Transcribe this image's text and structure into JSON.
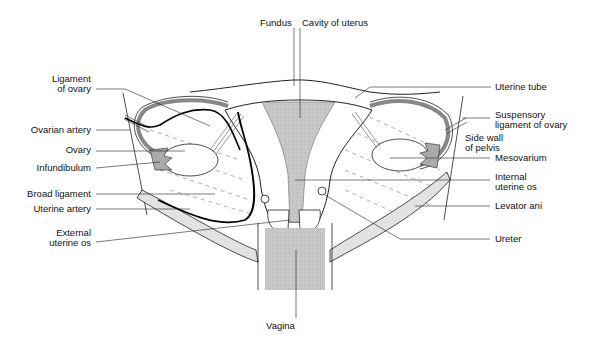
{
  "figure": {
    "colors": {
      "line": "#222222",
      "cavity_fill": "#c8c8c8",
      "muscle_fill": "#e2e2e2",
      "artery": "#000000",
      "background": "#ffffff"
    }
  },
  "labels": {
    "fundus": "Fundus",
    "cavity_of_uterus": "Cavity of uterus",
    "ligament_of_ovary": "Ligament\nof ovary",
    "ovarian_artery": "Ovarian artery",
    "ovary": "Ovary",
    "infundibulum": "Infundibulum",
    "broad_ligament": "Broad ligament",
    "uterine_artery": "Uterine artery",
    "external_uterine_os": "External\nuterine os",
    "uterine_tube": "Uterine tube",
    "suspensory_ligament": "Suspensory\nligament of ovary",
    "side_wall_of_pelvis": "Side wall\nof pelvis",
    "mesovarium": "Mesovarium",
    "internal_uterine_os": "Internal\nuterine os",
    "levator_ani": "Levator ani",
    "ureter": "Ureter",
    "vagina": "Vagina"
  }
}
